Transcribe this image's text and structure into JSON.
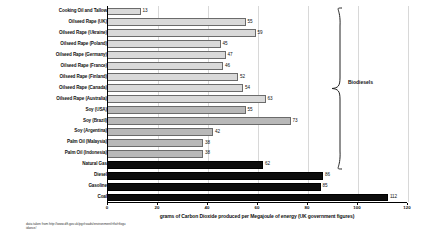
{
  "chart_data": {
    "type": "bar",
    "orientation": "horizontal",
    "title": "",
    "xlabel": "grams of Carbon Dioxide produced per Megajoule of energy (UK government figures)",
    "ylabel": "",
    "xlim": [
      0,
      120
    ],
    "xticks": [
      0,
      20,
      40,
      60,
      80,
      100,
      120
    ],
    "grid": true,
    "legend_position": "none",
    "categories": [
      "Cooking Oil and Tallow",
      "Oilseed Rape (UK)",
      "Oilseed Rape (Ukraine)",
      "Oilseed Rape (Poland)",
      "Oilseed Rape (Germany)",
      "Oilseed Rape (France)",
      "Oilseed Rape (Finland)",
      "Oilseed Rape (Canada)",
      "Oilseed Rape (Australia)",
      "Soy (USA)",
      "Soy (Brazil)",
      "Soy (Argentina)",
      "Palm Oil (Malaysia)",
      "Palm Oil (Indonesia)",
      "Natural Gas",
      "Diesel",
      "Gasoline",
      "Coal"
    ],
    "values": [
      13,
      55,
      59,
      45,
      47,
      46,
      52,
      54,
      63,
      55,
      73,
      42,
      38,
      38,
      62,
      86,
      85,
      112
    ],
    "bar_styles": [
      "light",
      "light",
      "light",
      "light",
      "light",
      "light",
      "light",
      "light",
      "light",
      "dark",
      "dark",
      "dark",
      "dark",
      "dark",
      "fossil",
      "fossil",
      "fossil",
      "fossil"
    ],
    "annotations": [
      {
        "text": "Biodiesels",
        "covers_rows": [
          0,
          13
        ]
      }
    ],
    "colors": {
      "bar_light": "#d9d9d9",
      "bar_dark": "#b8b8b8",
      "bar_fossil": "#0d0d0d",
      "bar_outline": "#6b6b6b",
      "gridline": "#d8d8d8",
      "axis": "#000000",
      "text": "#111111"
    }
  },
  "brace": {
    "label": "Biodiesels"
  },
  "source_note": "data taken from http://www.dft.gov.uk/pgr/roads/environment/rtfo/rtfoguidance/"
}
